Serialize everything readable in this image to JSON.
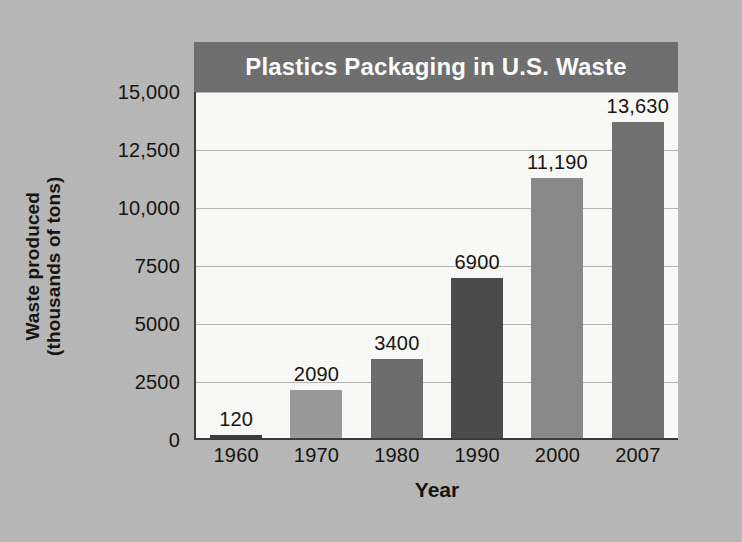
{
  "chart_data": {
    "type": "bar",
    "title": "Plastics Packaging in U.S. Waste",
    "xlabel": "Year",
    "ylabel": "Waste produced\n(thousands of tons)",
    "ylabel_line1": "Waste produced",
    "ylabel_line2": "(thousands of tons)",
    "categories": [
      "1960",
      "1970",
      "1980",
      "1990",
      "2000",
      "2007"
    ],
    "values": [
      120,
      2090,
      3400,
      6900,
      11190,
      13630
    ],
    "value_labels": [
      "120",
      "2090",
      "3400",
      "6900",
      "11,190",
      "13,630"
    ],
    "bar_colors": [
      "#3b3b3b",
      "#9a9a9a",
      "#6d6d6d",
      "#4a4a4a",
      "#8a8a8a",
      "#707070"
    ],
    "ylim": [
      0,
      15000
    ],
    "ytick_values": [
      0,
      2500,
      5000,
      7500,
      10000,
      12500,
      15000
    ],
    "ytick_labels": [
      "0",
      "2500",
      "5000",
      "7500",
      "10,000",
      "12,500",
      "15,000"
    ],
    "grid": true,
    "grid_axis": "y",
    "legend": false,
    "legend_position": "none",
    "series": [
      {
        "name": "Plastics packaging waste",
        "values": [
          120,
          2090,
          3400,
          6900,
          11190,
          13630
        ]
      }
    ]
  },
  "style": {
    "background_color": "#b9b9b9",
    "plot_background_color": "#fcfcfa",
    "title_band_color": "#6f6f6f",
    "title_text_color": "#ffffff",
    "axis_color": "#3a3a38",
    "gridline_color": "#b6b6b2",
    "text_color": "#15130f"
  }
}
